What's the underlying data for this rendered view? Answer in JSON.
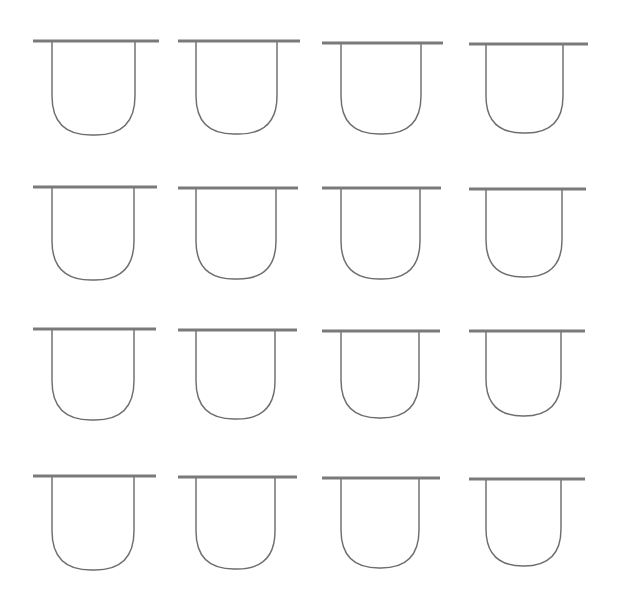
{
  "figure": {
    "type": "line-drawing-grid",
    "background_color": "#ffffff",
    "canvas_width": 618,
    "canvas_height": 606,
    "rows": 4,
    "columns": 4,
    "total_glyphs": 16
  },
  "style": {
    "outline_color": "#6e6e6e",
    "outline_width": 1.45,
    "bar_color": "#7a7a7a",
    "bar_width": 3.1,
    "fill": "none"
  },
  "glyph": {
    "name": "u-vessel",
    "description": "Rounded-bottom U outline crossed by a horizontal bar at the top that overhangs both sides",
    "parts": [
      "top-bar",
      "left-wall",
      "right-wall",
      "rounded-bottom"
    ]
  },
  "glyphs": [
    {
      "id": "glyph-r1c1",
      "row": 1,
      "col": 1,
      "bar_x1": 33,
      "bar_x2": 159,
      "bar_y": 41,
      "u_left": 52,
      "u_right": 135,
      "u_bottom": 135,
      "corner_radius": 39
    },
    {
      "id": "glyph-r1c2",
      "row": 1,
      "col": 2,
      "bar_x1": 178,
      "bar_x2": 300,
      "bar_y": 41,
      "u_left": 196,
      "u_right": 277,
      "u_bottom": 134,
      "corner_radius": 38
    },
    {
      "id": "glyph-r1c3",
      "row": 1,
      "col": 3,
      "bar_x1": 322,
      "bar_x2": 443,
      "bar_y": 43,
      "u_left": 341,
      "u_right": 421,
      "u_bottom": 134,
      "corner_radius": 38
    },
    {
      "id": "glyph-r1c4",
      "row": 1,
      "col": 4,
      "bar_x1": 469,
      "bar_x2": 588,
      "bar_y": 44,
      "u_left": 486,
      "u_right": 563,
      "u_bottom": 133,
      "corner_radius": 37
    },
    {
      "id": "glyph-r2c1",
      "row": 2,
      "col": 1,
      "bar_x1": 33,
      "bar_x2": 157,
      "bar_y": 187,
      "u_left": 52,
      "u_right": 134,
      "u_bottom": 280,
      "corner_radius": 39
    },
    {
      "id": "glyph-r2c2",
      "row": 2,
      "col": 2,
      "bar_x1": 178,
      "bar_x2": 298,
      "bar_y": 188,
      "u_left": 196,
      "u_right": 276,
      "u_bottom": 279,
      "corner_radius": 38
    },
    {
      "id": "glyph-r2c3",
      "row": 2,
      "col": 3,
      "bar_x1": 322,
      "bar_x2": 441,
      "bar_y": 188,
      "u_left": 341,
      "u_right": 420,
      "u_bottom": 279,
      "corner_radius": 38
    },
    {
      "id": "glyph-r2c4",
      "row": 2,
      "col": 4,
      "bar_x1": 469,
      "bar_x2": 586,
      "bar_y": 189,
      "u_left": 486,
      "u_right": 562,
      "u_bottom": 277,
      "corner_radius": 37
    },
    {
      "id": "glyph-r3c1",
      "row": 3,
      "col": 1,
      "bar_x1": 33,
      "bar_x2": 156,
      "bar_y": 329,
      "u_left": 52,
      "u_right": 134,
      "u_bottom": 420,
      "corner_radius": 39
    },
    {
      "id": "glyph-r3c2",
      "row": 3,
      "col": 2,
      "bar_x1": 178,
      "bar_x2": 297,
      "bar_y": 330,
      "u_left": 196,
      "u_right": 275,
      "u_bottom": 419,
      "corner_radius": 38
    },
    {
      "id": "glyph-r3c3",
      "row": 3,
      "col": 3,
      "bar_x1": 322,
      "bar_x2": 440,
      "bar_y": 331,
      "u_left": 341,
      "u_right": 419,
      "u_bottom": 418,
      "corner_radius": 38
    },
    {
      "id": "glyph-r3c4",
      "row": 3,
      "col": 4,
      "bar_x1": 469,
      "bar_x2": 585,
      "bar_y": 331,
      "u_left": 486,
      "u_right": 561,
      "u_bottom": 416,
      "corner_radius": 37
    },
    {
      "id": "glyph-r4c1",
      "row": 4,
      "col": 1,
      "bar_x1": 33,
      "bar_x2": 156,
      "bar_y": 476,
      "u_left": 52,
      "u_right": 134,
      "u_bottom": 570,
      "corner_radius": 39
    },
    {
      "id": "glyph-r4c2",
      "row": 4,
      "col": 2,
      "bar_x1": 178,
      "bar_x2": 297,
      "bar_y": 477,
      "u_left": 196,
      "u_right": 275,
      "u_bottom": 569,
      "corner_radius": 38
    },
    {
      "id": "glyph-r4c3",
      "row": 4,
      "col": 3,
      "bar_x1": 322,
      "bar_x2": 440,
      "bar_y": 478,
      "u_left": 341,
      "u_right": 419,
      "u_bottom": 568,
      "corner_radius": 38
    },
    {
      "id": "glyph-r4c4",
      "row": 4,
      "col": 4,
      "bar_x1": 469,
      "bar_x2": 585,
      "bar_y": 479,
      "u_left": 486,
      "u_right": 561,
      "u_bottom": 566,
      "corner_radius": 37
    }
  ]
}
